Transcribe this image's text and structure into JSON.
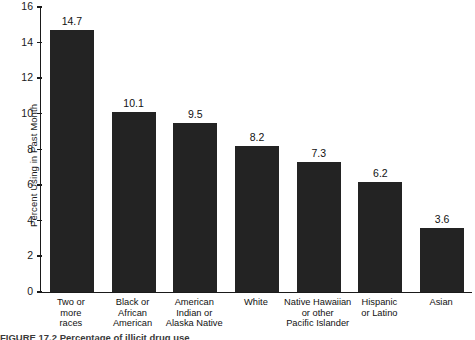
{
  "chart_data": {
    "type": "bar",
    "title": "",
    "xlabel": "",
    "ylabel": "Percent Using in Past Month",
    "ylim": [
      0,
      16
    ],
    "yticks": [
      0,
      2,
      4,
      6,
      8,
      10,
      12,
      14,
      16
    ],
    "grid": false,
    "legend": "none",
    "categories": [
      "Two or more races",
      "Black or African American",
      "American Indian or Alaska Native",
      "White",
      "Native Hawaiian or other Pacific Islander",
      "Hispanic or Latino",
      "Asian"
    ],
    "category_lines": [
      [
        "Two or",
        "more",
        "races"
      ],
      [
        "Black or",
        "African",
        "American"
      ],
      [
        "American",
        "Indian or",
        "Alaska Native"
      ],
      [
        "White"
      ],
      [
        "Native Hawaiian",
        "or other",
        "Pacific Islander"
      ],
      [
        "Hispanic",
        "or Latino"
      ],
      [
        "Asian"
      ]
    ],
    "values": [
      14.7,
      10.1,
      9.5,
      8.2,
      7.3,
      6.2,
      3.6
    ],
    "value_labels": [
      "14.7",
      "10.1",
      "9.5",
      "8.2",
      "7.3",
      "6.2",
      "3.6"
    ],
    "bar_color": "#232323",
    "axis_color": "#1a1a1a"
  },
  "caption": {
    "cut_off_text": "FIGURE 17.2  Percentage of illicit drug use"
  }
}
